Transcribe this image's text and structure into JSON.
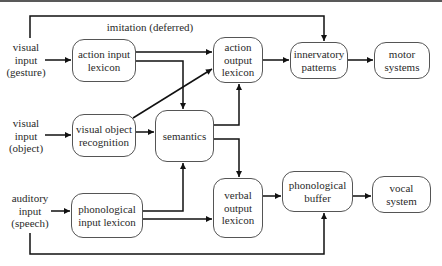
{
  "diagram": {
    "inputs": [
      {
        "id": "gesture",
        "text": "visual\ninput\n(gesture)"
      },
      {
        "id": "object",
        "text": "visual\ninput\n(object)"
      },
      {
        "id": "speech",
        "text": "auditory\ninput\n(speech)"
      }
    ],
    "annotation": {
      "imitation": "imitation (deferred)"
    },
    "nodes": {
      "action_input_lexicon": "action input\nlexicon",
      "visual_object_recognition": "visual object\nrecognition",
      "semantics": "semantics",
      "action_output_lexicon": "action\noutput\nlexicon",
      "innervatory_patterns": "innervatory\npatterns",
      "motor_systems": "motor\nsystems",
      "phonological_input_lexicon": "phonological\ninput lexicon",
      "verbal_output_lexicon": "verbal\noutput\nlexicon",
      "phonological_buffer": "phonological\nbuffer",
      "vocal_system": "vocal\nsystem"
    },
    "edges": [
      [
        "gesture",
        "action_input_lexicon"
      ],
      [
        "object",
        "visual_object_recognition"
      ],
      [
        "speech",
        "phonological_input_lexicon"
      ],
      [
        "gesture",
        "innervatory_patterns",
        "imitation (deferred)"
      ],
      [
        "speech",
        "phonological_buffer"
      ],
      [
        "action_input_lexicon",
        "action_output_lexicon"
      ],
      [
        "action_input_lexicon",
        "semantics"
      ],
      [
        "visual_object_recognition",
        "action_output_lexicon"
      ],
      [
        "visual_object_recognition",
        "semantics"
      ],
      [
        "phonological_input_lexicon",
        "semantics"
      ],
      [
        "phonological_input_lexicon",
        "verbal_output_lexicon"
      ],
      [
        "semantics",
        "action_output_lexicon"
      ],
      [
        "semantics",
        "verbal_output_lexicon"
      ],
      [
        "action_output_lexicon",
        "innervatory_patterns"
      ],
      [
        "innervatory_patterns",
        "motor_systems"
      ],
      [
        "verbal_output_lexicon",
        "phonological_buffer"
      ],
      [
        "phonological_buffer",
        "vocal_system"
      ]
    ]
  }
}
